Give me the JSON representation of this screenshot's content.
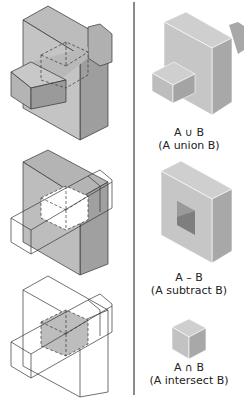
{
  "figure": {
    "colors": {
      "face_light": "#c8c8c8",
      "face_mid": "#b4b4b4",
      "face_dark": "#9a9a9a",
      "edge": "#333333",
      "divider": "#8a8a8a",
      "intersect_fill": "#bdbdbd"
    },
    "left_column": [
      {
        "name": "union-setup",
        "description": "Block A with bar B passing through, hidden edges dashed"
      },
      {
        "name": "subtract-setup",
        "description": "Block A shaded with B as wireframe, hole region dashed"
      },
      {
        "name": "intersect-setup",
        "description": "Wireframe of A and B with overlapping cube shaded"
      }
    ],
    "right_column": [
      {
        "symbol_line": "A ∪ B",
        "caption": "(A union B)"
      },
      {
        "symbol_line": "A – B",
        "caption": "(A subtract B)"
      },
      {
        "symbol_line": "A ∩ B",
        "caption": "(A intersect B)"
      }
    ]
  }
}
